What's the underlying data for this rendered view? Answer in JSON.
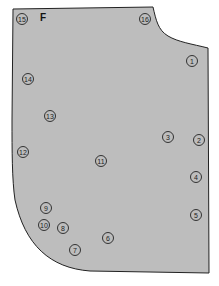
{
  "diagram": {
    "type": "sewing-pattern-piece",
    "piece_label": "F",
    "colors": {
      "piece_fill": "#bdbdbd",
      "outline": "#222222",
      "background": "#ffffff"
    },
    "markers": [
      {
        "id": "1",
        "label": "1"
      },
      {
        "id": "2",
        "label": "2"
      },
      {
        "id": "3",
        "label": "3"
      },
      {
        "id": "4",
        "label": "4"
      },
      {
        "id": "5",
        "label": "5"
      },
      {
        "id": "6",
        "label": "6"
      },
      {
        "id": "7",
        "label": "7"
      },
      {
        "id": "8",
        "label": "8"
      },
      {
        "id": "9",
        "label": "9"
      },
      {
        "id": "10",
        "label": "10"
      },
      {
        "id": "11",
        "label": "11"
      },
      {
        "id": "12",
        "label": "12"
      },
      {
        "id": "13",
        "label": "13"
      },
      {
        "id": "14",
        "label": "14"
      },
      {
        "id": "15",
        "label": "15"
      },
      {
        "id": "16",
        "label": "16"
      }
    ]
  }
}
